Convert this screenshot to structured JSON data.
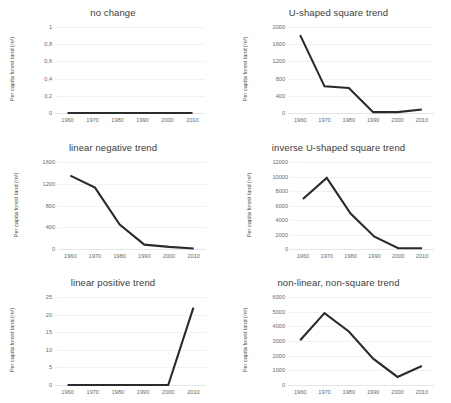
{
  "figure": {
    "panel_count": 6,
    "line_color": "#2b2b2b",
    "grid_color": "#f1f1f3",
    "background": "#ffffff"
  },
  "chart_data": [
    {
      "type": "line",
      "title": "no change",
      "xlabel": "",
      "ylabel": "Per capita forest land (m²)",
      "x": [
        1960,
        1970,
        1980,
        1990,
        2000,
        2010
      ],
      "xticks": [
        "1960",
        "1970",
        "1980",
        "1990",
        "2000",
        "2010"
      ],
      "values": [
        0,
        0,
        0,
        0,
        0,
        0
      ],
      "yticks": [
        0,
        0.2,
        0.4,
        0.6,
        0.8,
        1
      ],
      "ytick_labels": [
        "0",
        "0,2",
        "0,4",
        "0,6",
        "0,8",
        "1"
      ],
      "ylim": [
        0,
        1
      ],
      "grid": true,
      "legend": "none"
    },
    {
      "type": "line",
      "title": "U-shaped square trend",
      "xlabel": "",
      "ylabel": "Per capita forest land (m²)",
      "x": [
        1960,
        1970,
        1980,
        1990,
        2000,
        2010
      ],
      "xticks": [
        "1960",
        "1970",
        "1980",
        "1990",
        "2000",
        "2010"
      ],
      "values": [
        1810,
        620,
        580,
        20,
        20,
        80
      ],
      "yticks": [
        0,
        400,
        800,
        1200,
        1600,
        2000
      ],
      "ytick_labels": [
        "0",
        "400",
        "800",
        "1200",
        "1600",
        "2000"
      ],
      "ylim": [
        0,
        2000
      ],
      "grid": true,
      "legend": "none"
    },
    {
      "type": "line",
      "title": "linear negative trend",
      "xlabel": "",
      "ylabel": "Per capita forest land (m²)",
      "x": [
        1960,
        1970,
        1980,
        1990,
        2000,
        2010
      ],
      "xticks": [
        "1960",
        "1970",
        "1980",
        "1990",
        "2000",
        "2010"
      ],
      "values": [
        1350,
        1130,
        450,
        80,
        40,
        10
      ],
      "yticks": [
        0,
        400,
        800,
        1200,
        1600
      ],
      "ytick_labels": [
        "0",
        "400",
        "800",
        "1200",
        "1600"
      ],
      "ylim": [
        0,
        1600
      ],
      "grid": true,
      "legend": "none"
    },
    {
      "type": "line",
      "title": "inverse U-shaped square trend",
      "xlabel": "",
      "ylabel": "Per capita forest land (m²)",
      "x": [
        1960,
        1970,
        1980,
        1990,
        2000,
        2010
      ],
      "xticks": [
        "1960",
        "1970",
        "1980",
        "1990",
        "2000",
        "2010"
      ],
      "values": [
        6900,
        9800,
        4900,
        1700,
        100,
        100
      ],
      "yticks": [
        0,
        2000,
        4000,
        6000,
        8000,
        10000,
        12000
      ],
      "ytick_labels": [
        "0",
        "2000",
        "4000",
        "6000",
        "8000",
        "10000",
        "12000"
      ],
      "ylim": [
        0,
        12000
      ],
      "grid": true,
      "legend": "none"
    },
    {
      "type": "line",
      "title": "linear positive trend",
      "xlabel": "",
      "ylabel": "Per capita forest land (m²)",
      "x": [
        1960,
        1970,
        1980,
        1990,
        2000,
        2010
      ],
      "xticks": [
        "1960",
        "1970",
        "1980",
        "1990",
        "2000",
        "2010"
      ],
      "values": [
        0,
        0,
        0,
        0,
        0,
        22
      ],
      "yticks": [
        0,
        5,
        10,
        15,
        20,
        25
      ],
      "ytick_labels": [
        "0",
        "5",
        "10",
        "15",
        "20",
        "25"
      ],
      "ylim": [
        0,
        25
      ],
      "grid": true,
      "legend": "none"
    },
    {
      "type": "line",
      "title": "non-linear, non-square trend",
      "xlabel": "",
      "ylabel": "Per capita forest land (m²)",
      "x": [
        1960,
        1970,
        1980,
        1990,
        2000,
        2010
      ],
      "xticks": [
        "1960",
        "1970",
        "1980",
        "1990",
        "2000",
        "2010"
      ],
      "values": [
        3050,
        4900,
        3650,
        1800,
        550,
        1300
      ],
      "yticks": [
        0,
        1000,
        2000,
        3000,
        4000,
        5000,
        6000
      ],
      "ytick_labels": [
        "0",
        "1000",
        "2000",
        "3000",
        "4000",
        "5000",
        "6000"
      ],
      "ylim": [
        0,
        6000
      ],
      "grid": true,
      "legend": "none"
    }
  ]
}
